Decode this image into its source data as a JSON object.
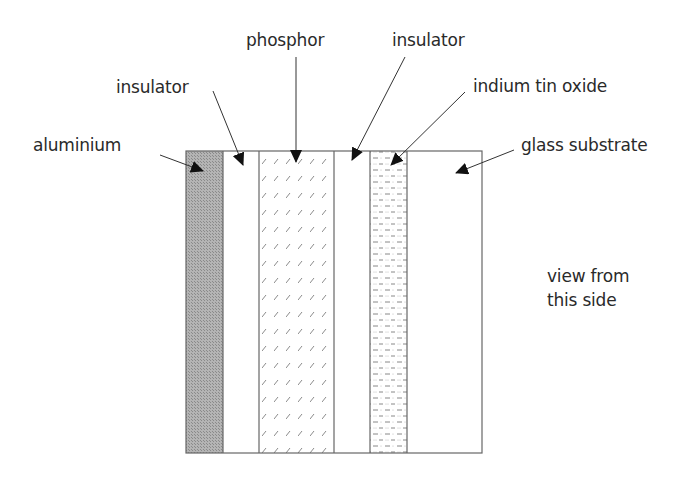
{
  "diagram": {
    "type": "layer-cross-section",
    "labels": {
      "aluminium": "aluminium",
      "insulator_left": "insulator",
      "phosphor": "phosphor",
      "insulator_right": "insulator",
      "ito": "indium tin oxide",
      "glass": "glass substrate",
      "view_line1": "view from",
      "view_line2": "this side"
    },
    "layers": [
      {
        "name": "aluminium",
        "x0": 186,
        "x1": 223,
        "fill": "crosshatch-grey"
      },
      {
        "name": "insulator",
        "x0": 223,
        "x1": 259,
        "fill": "white"
      },
      {
        "name": "phosphor",
        "x0": 259,
        "x1": 334,
        "fill": "slash-pattern"
      },
      {
        "name": "insulator",
        "x0": 334,
        "x1": 370,
        "fill": "white"
      },
      {
        "name": "indium tin oxide",
        "x0": 370,
        "x1": 407,
        "fill": "dash-dot-pattern"
      },
      {
        "name": "glass substrate",
        "x0": 407,
        "x1": 482,
        "fill": "white"
      }
    ],
    "colors": {
      "line": "#555555",
      "aluminium": "#a8a8a8",
      "text": "#2a2a2a",
      "arrow": "#111111"
    }
  }
}
